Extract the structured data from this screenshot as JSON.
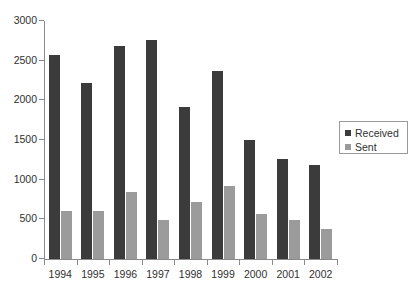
{
  "chart_data": {
    "type": "bar",
    "title": "",
    "subtitle": "",
    "xlabel": "",
    "ylabel": "",
    "categories": [
      "1994",
      "1995",
      "1996",
      "1997",
      "1998",
      "1999",
      "2000",
      "2001",
      "2002"
    ],
    "series": [
      {
        "name": "Received",
        "color": "#3b3b3b",
        "values": [
          2570,
          2220,
          2685,
          2760,
          1920,
          2375,
          1500,
          1265,
          1185
        ]
      },
      {
        "name": "Sent",
        "color": "#9b9b9b",
        "values": [
          605,
          600,
          845,
          490,
          720,
          925,
          565,
          490,
          380
        ]
      }
    ],
    "ylim": [
      0,
      3000
    ],
    "ytick_values": [
      0,
      500,
      1000,
      1500,
      2000,
      2500,
      3000
    ],
    "ytick_labels": [
      "0",
      "500",
      "1000",
      "1500",
      "2000",
      "2500",
      "3000"
    ],
    "grid": false,
    "legend_position": "right"
  },
  "legend": {
    "entries": [
      {
        "label": "Received",
        "swatch": "#3b3b3b"
      },
      {
        "label": "Sent",
        "swatch": "#9b9b9b"
      }
    ]
  },
  "colors": {
    "received": "#3b3b3b",
    "sent": "#9b9b9b",
    "axis": "#8a8a8a",
    "text": "#303030",
    "background": "#ffffff"
  }
}
